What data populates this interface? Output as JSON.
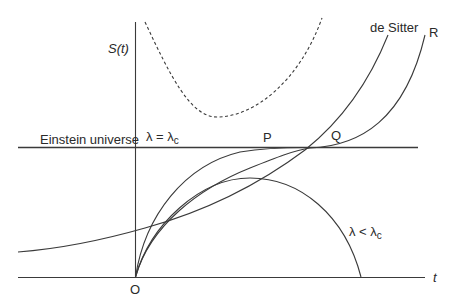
{
  "axes": {
    "y_label": "S(t)",
    "x_label": "t",
    "origin_label": "O"
  },
  "labels": {
    "einstein_universe": "Einstein universe",
    "lambda_eq": "λ = λ",
    "lambda_eq_sub": "c",
    "lambda_lt": "λ < λ",
    "lambda_lt_sub": "c",
    "de_sitter": "de Sitter",
    "point_p": "P",
    "point_q": "Q",
    "point_r": "R"
  },
  "colors": {
    "line": "#3a3a3a",
    "text": "#2a2a2a",
    "background": "#ffffff"
  },
  "curves": [
    {
      "name": "einstein-universe",
      "style": "solid",
      "description": "horizontal static line"
    },
    {
      "name": "de-sitter",
      "style": "solid",
      "description": "exponential growth from t → -∞"
    },
    {
      "name": "lambda-equals-critical",
      "style": "solid",
      "description": "from big bang asymptotically approaching Einstein line at P"
    },
    {
      "name": "curve-r",
      "style": "solid",
      "description": "from big bang, coasting near P, then accelerating past Q to R"
    },
    {
      "name": "lambda-less-than-critical",
      "style": "solid",
      "description": "recollapsing universe"
    },
    {
      "name": "bouncing",
      "style": "dashed",
      "description": "bouncing universe with no singularity"
    }
  ]
}
